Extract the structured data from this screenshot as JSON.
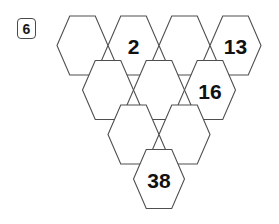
{
  "problem": {
    "number_label": "6"
  },
  "figure": {
    "type": "hexagon-triangle-grid",
    "orientation": "flat-top",
    "rows": [
      {
        "row_index": 0,
        "count": 4,
        "cells": [
          {
            "id": "r0c0",
            "value": ""
          },
          {
            "id": "r0c1",
            "value": "2"
          },
          {
            "id": "r0c2",
            "value": ""
          },
          {
            "id": "r0c3",
            "value": "13"
          }
        ]
      },
      {
        "row_index": 1,
        "count": 3,
        "cells": [
          {
            "id": "r1c0",
            "value": ""
          },
          {
            "id": "r1c1",
            "value": ""
          },
          {
            "id": "r1c2",
            "value": "16"
          }
        ]
      },
      {
        "row_index": 2,
        "count": 2,
        "cells": [
          {
            "id": "r2c0",
            "value": ""
          },
          {
            "id": "r2c1",
            "value": ""
          }
        ]
      },
      {
        "row_index": 3,
        "count": 1,
        "cells": [
          {
            "id": "r3c0",
            "value": "38"
          }
        ]
      }
    ],
    "given_values": [
      "2",
      "13",
      "16",
      "38"
    ],
    "colors": {
      "background": "#ffffff",
      "hex_fill": "#ffffff",
      "hex_stroke": "#4f4f4f",
      "label_text": "#111111",
      "badge_border": "#4a4a4a"
    },
    "geometry": {
      "hex_width": 51,
      "hex_height": 59,
      "origin_x": 57,
      "origin_y": 16,
      "row_dx": 25.5,
      "row_dy": 44.5
    }
  }
}
